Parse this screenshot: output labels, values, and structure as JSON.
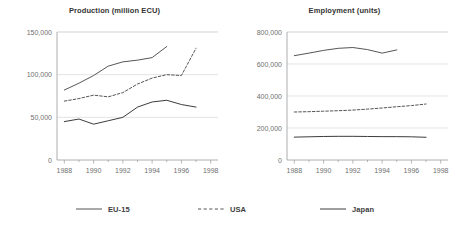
{
  "legend": {
    "position": "bottom",
    "items": [
      {
        "label": "EU-15",
        "style": "solid",
        "color": "#55555a"
      },
      {
        "label": "USA",
        "style": "dashed",
        "color": "#55555a"
      },
      {
        "label": "Japan",
        "style": "solid",
        "color": "#3c3c40"
      }
    ]
  },
  "chart_data": [
    {
      "type": "line",
      "id": "production",
      "title": "Production (million ECU)",
      "xlabel": "",
      "ylabel": "",
      "grid": true,
      "legend_position": "bottom",
      "xlim": [
        1987.5,
        1998.5
      ],
      "ylim": [
        0,
        150000
      ],
      "xticks": [
        1988,
        1990,
        1992,
        1994,
        1996,
        1998
      ],
      "xtick_labels": [
        "1988",
        "1990",
        "1992",
        "1994",
        "1996",
        "1998"
      ],
      "yticks": [
        0,
        50000,
        100000,
        150000
      ],
      "ytick_labels": [
        "0",
        "50,000",
        "100,000",
        "150,000"
      ],
      "x": [
        1988,
        1989,
        1990,
        1991,
        1992,
        1993,
        1994,
        1995,
        1996,
        1997
      ],
      "series": [
        {
          "name": "EU-15",
          "style": "solid",
          "values": [
            82000,
            90000,
            99000,
            110000,
            115000,
            117000,
            120000,
            133000,
            null,
            null
          ]
        },
        {
          "name": "USA",
          "style": "dashed",
          "values": [
            69000,
            72000,
            76000,
            74000,
            79000,
            89000,
            96000,
            100000,
            99000,
            131000
          ]
        },
        {
          "name": "Japan",
          "style": "solid",
          "values": [
            45000,
            48000,
            42000,
            46000,
            50000,
            62000,
            68000,
            70000,
            65000,
            62000
          ]
        }
      ]
    },
    {
      "type": "line",
      "id": "employment",
      "title": "Employment (units)",
      "xlabel": "",
      "ylabel": "",
      "grid": true,
      "legend_position": "bottom",
      "xlim": [
        1987.5,
        1998.5
      ],
      "ylim": [
        0,
        800000
      ],
      "xticks": [
        1988,
        1990,
        1992,
        1994,
        1996,
        1998
      ],
      "xtick_labels": [
        "1988",
        "1990",
        "1992",
        "1994",
        "1996",
        "1998"
      ],
      "yticks": [
        0,
        200000,
        400000,
        600000,
        800000
      ],
      "ytick_labels": [
        "0",
        "200,000",
        "400,000",
        "600,000",
        "800,000"
      ],
      "x": [
        1988,
        1989,
        1990,
        1991,
        1992,
        1993,
        1994,
        1995,
        1996,
        1997
      ],
      "series": [
        {
          "name": "EU-15",
          "style": "solid",
          "values": [
            652000,
            668000,
            685000,
            698000,
            703000,
            690000,
            668000,
            688000,
            null,
            null
          ]
        },
        {
          "name": "USA",
          "style": "dashed",
          "values": [
            300000,
            302000,
            305000,
            308000,
            312000,
            318000,
            325000,
            333000,
            340000,
            350000
          ]
        },
        {
          "name": "Japan",
          "style": "solid",
          "values": [
            143000,
            145000,
            147000,
            148000,
            148000,
            147000,
            146000,
            146000,
            145000,
            142000
          ]
        }
      ]
    }
  ]
}
